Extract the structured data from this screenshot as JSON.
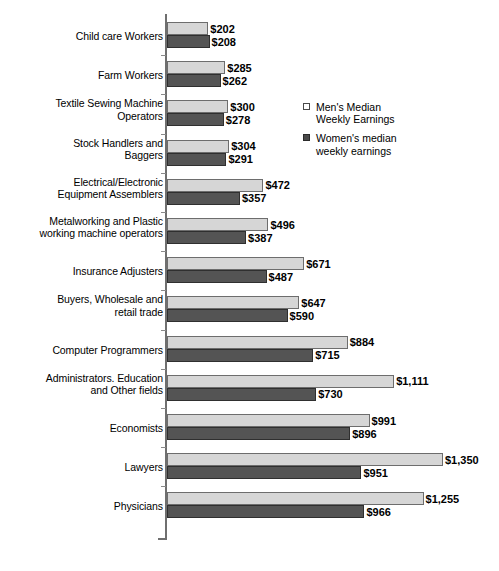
{
  "chart_data": {
    "type": "bar",
    "orientation": "horizontal",
    "title": "",
    "xlabel": "",
    "ylabel": "",
    "xlim": [
      0,
      1350
    ],
    "grid": false,
    "legend_position": "upper-right-inside",
    "value_prefix": "$",
    "categories": [
      "Child care Workers",
      "Farm Workers",
      "Textile Sewing Machine Operators",
      "Stock Handlers and Baggers",
      "Electrical/Electronic Equipment Assemblers",
      "Metalworking and Plastic working machine operators",
      "Insurance Adjusters",
      "Buyers, Wholesale and retail trade",
      "Computer Programmers",
      "Administrators. Education and Other fields",
      "Economists",
      "Lawyers",
      "Physicians"
    ],
    "series": [
      {
        "name": "Men's Median Weekly Earnings",
        "color": "#d6d6d6",
        "values": [
          202,
          285,
          300,
          304,
          472,
          496,
          671,
          647,
          884,
          1111,
          991,
          1350,
          1255
        ],
        "labels": [
          "$202",
          "$285",
          "$300",
          "$304",
          "$472",
          "$496",
          "$671",
          "$647",
          "$884",
          "$1,111",
          "$991",
          "$1,350",
          "$1,255"
        ]
      },
      {
        "name": "Women's median weekly earnings",
        "color": "#545454",
        "values": [
          208,
          262,
          278,
          291,
          357,
          387,
          487,
          590,
          715,
          730,
          896,
          951,
          966
        ],
        "labels": [
          "$208",
          "$262",
          "$278",
          "$291",
          "$357",
          "$387",
          "$487",
          "$590",
          "$715",
          "$730",
          "$896",
          "$951",
          "$966"
        ]
      }
    ]
  },
  "rows": [
    {
      "label_lines": [
        "Child care Workers"
      ],
      "men": "$202",
      "women": "$208",
      "men_val": 202,
      "women_val": 208
    },
    {
      "label_lines": [
        "Farm Workers"
      ],
      "men": "$285",
      "women": "$262",
      "men_val": 285,
      "women_val": 262
    },
    {
      "label_lines": [
        "Textile Sewing Machine",
        "Operators"
      ],
      "men": "$300",
      "women": "$278",
      "men_val": 300,
      "women_val": 278
    },
    {
      "label_lines": [
        "Stock Handlers and",
        "Baggers"
      ],
      "men": "$304",
      "women": "$291",
      "men_val": 304,
      "women_val": 291
    },
    {
      "label_lines": [
        "Electrical/Electronic",
        "Equipment Assemblers"
      ],
      "men": "$472",
      "women": "$357",
      "men_val": 472,
      "women_val": 357
    },
    {
      "label_lines": [
        "Metalworking and Plastic",
        "working machine operators"
      ],
      "men": "$496",
      "women": "$387",
      "men_val": 496,
      "women_val": 387
    },
    {
      "label_lines": [
        "Insurance Adjusters"
      ],
      "men": "$671",
      "women": "$487",
      "men_val": 671,
      "women_val": 487
    },
    {
      "label_lines": [
        "Buyers, Wholesale and",
        "retail trade"
      ],
      "men": "$647",
      "women": "$590",
      "men_val": 647,
      "women_val": 590
    },
    {
      "label_lines": [
        "Computer Programmers"
      ],
      "men": "$884",
      "women": "$715",
      "men_val": 884,
      "women_val": 715
    },
    {
      "label_lines": [
        "Administrators. Education",
        "and Other fields"
      ],
      "men": "$1,111",
      "women": "$730",
      "men_val": 1111,
      "women_val": 730
    },
    {
      "label_lines": [
        "Economists"
      ],
      "men": "$991",
      "women": "$896",
      "men_val": 991,
      "women_val": 896
    },
    {
      "label_lines": [
        "Lawyers"
      ],
      "men": "$1,350",
      "women": "$951",
      "men_val": 1350,
      "women_val": 951
    },
    {
      "label_lines": [
        "Physicians"
      ],
      "men": "$1,255",
      "women": "$966",
      "men_val": 1255,
      "women_val": 966
    }
  ],
  "legend": {
    "items": [
      {
        "swatch": "men",
        "lines": [
          "Men's Median",
          "Weekly Earnings"
        ]
      },
      {
        "swatch": "women",
        "lines": [
          "Women's median",
          "weekly earnings"
        ]
      }
    ]
  },
  "caption_fragments": []
}
